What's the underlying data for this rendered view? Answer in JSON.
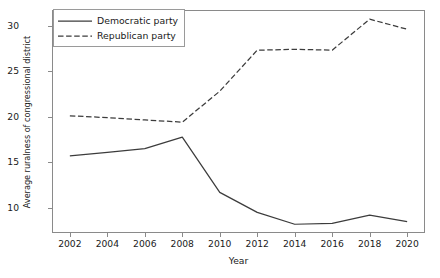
{
  "chart_data": {
    "type": "line",
    "title": "",
    "xlabel": "Year",
    "ylabel": "Average ruralness of congressional district",
    "x": [
      2002,
      2004,
      2006,
      2008,
      2010,
      2012,
      2014,
      2016,
      2018,
      2020
    ],
    "xtick_labels": [
      "2002",
      "2004",
      "2006",
      "2008",
      "2010",
      "2012",
      "2014",
      "2016",
      "2018",
      "2020"
    ],
    "ytick_labels": [
      "10",
      "15",
      "20",
      "25",
      "30"
    ],
    "ytick_values": [
      10,
      15,
      20,
      25,
      30
    ],
    "xlim": [
      2001.1,
      2020.9
    ],
    "ylim": [
      7.35,
      31.6
    ],
    "grid": false,
    "legend_position": "upper left",
    "series": [
      {
        "name": "Democratic party",
        "linestyle": "solid",
        "color": "#3c3c3c",
        "values": [
          15.7,
          16.1,
          16.5,
          17.75,
          11.7,
          9.5,
          8.2,
          8.3,
          9.2,
          8.5
        ]
      },
      {
        "name": "Republican party",
        "linestyle": "dashed",
        "color": "#3c3c3c",
        "values": [
          20.1,
          19.9,
          19.65,
          19.4,
          22.8,
          27.3,
          27.4,
          27.3,
          30.7,
          29.6
        ]
      }
    ]
  },
  "legend": {
    "items": [
      {
        "label": "Democratic party",
        "style": "solid"
      },
      {
        "label": "Republican party",
        "style": "dashed"
      }
    ]
  },
  "axes": {
    "frame_color": "#8a8a8a"
  }
}
